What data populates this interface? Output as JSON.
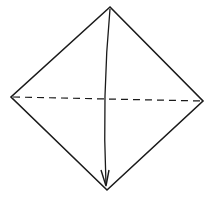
{
  "diagram": {
    "type": "origami-fold-step",
    "background": "#ffffff",
    "stroke_color": "#1a1a1a",
    "square": {
      "shape": "diamond",
      "vertices": {
        "top": [
          110,
          7
        ],
        "right": [
          203,
          101
        ],
        "bottom": [
          107,
          190
        ],
        "left": [
          11,
          97
        ]
      }
    },
    "fold_line": {
      "style": "dashed",
      "kind": "valley-fold",
      "from": [
        13,
        97
      ],
      "to": [
        202,
        101
      ]
    },
    "arrow": {
      "meaning": "fold top corner down to bottom corner",
      "from": [
        110,
        9
      ],
      "to": [
        106,
        185
      ]
    }
  }
}
